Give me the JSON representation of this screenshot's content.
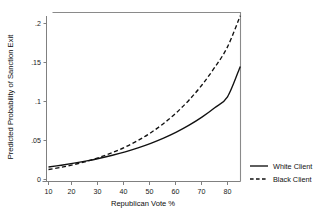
{
  "chart_data": {
    "type": "line",
    "title": "",
    "xlabel": "Republican Vote %",
    "ylabel": "Predicted Probability of Sanction Exit",
    "xlim": [
      8,
      86
    ],
    "ylim": [
      0,
      0.215
    ],
    "xticks": [
      10,
      20,
      30,
      40,
      50,
      60,
      70,
      80
    ],
    "xticklabels": [
      "10",
      "20",
      "30",
      "40",
      "50",
      "60",
      "70",
      "80"
    ],
    "yticks": [
      0,
      0.05,
      0.1,
      0.15,
      0.2
    ],
    "yticklabels": [
      "0",
      ".05",
      ".1",
      ".15",
      ".2"
    ],
    "grid": false,
    "legend_position": "right-outside",
    "x": [
      10,
      15,
      20,
      25,
      30,
      35,
      40,
      45,
      50,
      55,
      60,
      65,
      70,
      75,
      80,
      85
    ],
    "series": [
      {
        "name": "White Client",
        "style": "solid",
        "color": "#111111",
        "values": [
          0.016,
          0.0183,
          0.0209,
          0.0238,
          0.0272,
          0.0311,
          0.0355,
          0.0406,
          0.0464,
          0.0531,
          0.0608,
          0.0697,
          0.08,
          0.092,
          0.106,
          0.145
        ]
      },
      {
        "name": "Black Client",
        "style": "dashed",
        "color": "#111111",
        "values": [
          0.0128,
          0.0157,
          0.0192,
          0.0234,
          0.0285,
          0.0345,
          0.0416,
          0.05,
          0.06,
          0.0718,
          0.0857,
          0.102,
          0.1212,
          0.1437,
          0.17,
          0.21
        ]
      }
    ],
    "annotations": {
      "crossover_x": 45,
      "note": "Dashed Black Client curve overtakes solid White Client curve near 45% Republican vote."
    }
  },
  "legend": {
    "items": [
      {
        "label": "White Client",
        "style": "solid"
      },
      {
        "label": "Black Client",
        "style": "dashed"
      }
    ]
  }
}
